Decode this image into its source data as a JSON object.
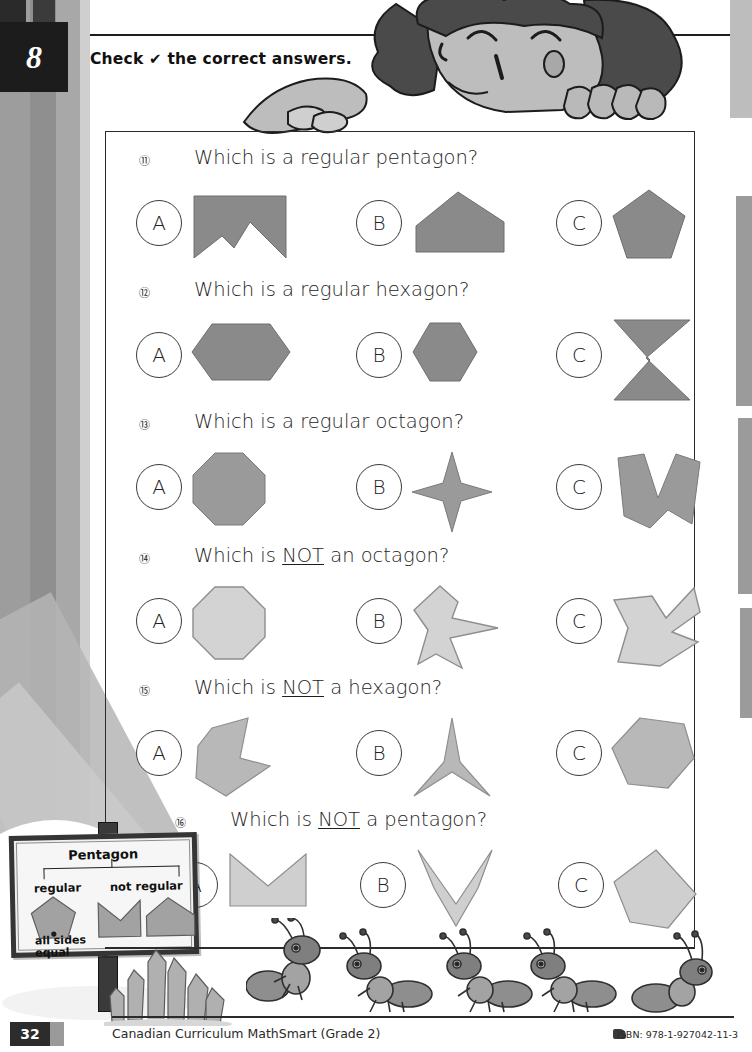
{
  "page": {
    "chapter_number": "8",
    "instruction": "Check ✔ the correct answers.",
    "instruction_prefix": "Check",
    "instruction_check": "✔",
    "instruction_suffix": "the correct answers."
  },
  "questions": [
    {
      "number": "⑪",
      "text_before": "Which is a regular pentagon?",
      "emphasis": "",
      "text_after": "",
      "shape_fill": "#8a8a8a",
      "shape_stroke": "#6e6e6e",
      "options": [
        {
          "label": "A",
          "shape": "concave-pentagon-notch"
        },
        {
          "label": "B",
          "shape": "house-pentagon"
        },
        {
          "label": "C",
          "shape": "regular-pentagon"
        }
      ]
    },
    {
      "number": "⑫",
      "text_before": "Which is a regular hexagon?",
      "emphasis": "",
      "text_after": "",
      "shape_fill": "#8a8a8a",
      "shape_stroke": "#6e6e6e",
      "options": [
        {
          "label": "A",
          "shape": "wide-hexagon"
        },
        {
          "label": "B",
          "shape": "regular-hexagon"
        },
        {
          "label": "C",
          "shape": "bowtie-hexagon"
        }
      ]
    },
    {
      "number": "⑬",
      "text_before": "Which is a regular octagon?",
      "emphasis": "",
      "text_after": "",
      "shape_fill": "#9a9a9a",
      "shape_stroke": "#7b7b7b",
      "options": [
        {
          "label": "A",
          "shape": "regular-octagon"
        },
        {
          "label": "B",
          "shape": "four-point-star"
        },
        {
          "label": "C",
          "shape": "zigzag-w-octagon"
        }
      ]
    },
    {
      "number": "⑭",
      "text_before": "Which is ",
      "emphasis": "NOT",
      "text_after": " an octagon?",
      "shape_fill": "#d3d3d3",
      "shape_stroke": "#8e8e8e",
      "options": [
        {
          "label": "A",
          "shape": "regular-octagon"
        },
        {
          "label": "B",
          "shape": "arrow-octagon"
        },
        {
          "label": "C",
          "shape": "check-octagon"
        }
      ]
    },
    {
      "number": "⑮",
      "text_before": "Which is ",
      "emphasis": "NOT",
      "text_after": " a hexagon?",
      "shape_fill": "#b8b8b8",
      "shape_stroke": "#8e8e8e",
      "options": [
        {
          "label": "A",
          "shape": "concave-hexagon"
        },
        {
          "label": "B",
          "shape": "three-point-star"
        },
        {
          "label": "C",
          "shape": "tilted-hexagon"
        }
      ]
    },
    {
      "number": "⑯",
      "text_before": "Which is ",
      "emphasis": "NOT",
      "text_after": " a pentagon?",
      "shape_fill": "#cfcfcf",
      "shape_stroke": "#8e8e8e",
      "options": [
        {
          "label": "A",
          "shape": "m-notch-pentagon"
        },
        {
          "label": "B",
          "shape": "chevron-pentagon"
        },
        {
          "label": "C",
          "shape": "tilted-pentagon"
        }
      ]
    }
  ],
  "sign": {
    "title": "Pentagon",
    "left_label": "regular",
    "right_label": "not regular",
    "caption_line1": "all sides",
    "caption_line2": "equal"
  },
  "footer": {
    "page_number": "32",
    "title": "Canadian Curriculum MathSmart (Grade 2)",
    "isbn": "ISBN: 978-1-927042-11-3"
  },
  "colors": {
    "ink": "#1d1d1d",
    "panel_border": "#2b2b2b",
    "dark_block": "#1c1c1c",
    "shape_dark": "#8a8a8a",
    "shape_light": "#d3d3d3"
  }
}
